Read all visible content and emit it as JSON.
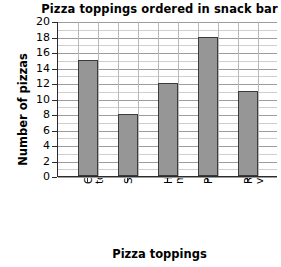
{
  "chart_data": {
    "type": "bar",
    "title": "Pizza toppings ordered in snack bar",
    "xlabel": "Pizza toppings",
    "ylabel": "Number of pizzas",
    "categories": [
      "Cheese &\ntomato",
      "Seafood",
      "Ham &\nmushroom",
      "Pepperoni",
      "Roasted\nvegetable"
    ],
    "values": [
      15,
      8,
      12,
      18,
      11
    ],
    "ylim": [
      0,
      20
    ],
    "ytick_step": 2,
    "yticks": [
      0,
      2,
      4,
      6,
      8,
      10,
      12,
      14,
      16,
      18,
      20
    ],
    "ytick_labels": [
      "0",
      "2",
      "4",
      "6",
      "8",
      "10",
      "12",
      "14",
      "16",
      "18",
      "20"
    ],
    "grid": true,
    "minor_grid_step": 1,
    "legend": null,
    "bar_color": "#969696",
    "bar_edge_color": "#3a3a3a",
    "axis_color": "#2b2b2b",
    "grid_color": "#cfcfcf",
    "grid_major_color": "#9b9b9b"
  }
}
